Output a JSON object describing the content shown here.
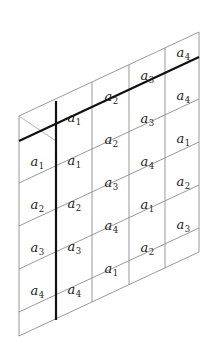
{
  "figure": {
    "geometry": {
      "canvas_width": 218,
      "canvas_height": 354,
      "columns": 5,
      "rows": 5,
      "column_width": 36,
      "row_height": 43,
      "column_rise": 21,
      "left_edge_x": 19,
      "right_edge_x": 199,
      "left_edge_top_y": 116,
      "left_edge_bottom_y": 336,
      "right_edge_top_y": 32,
      "right_edge_bottom_y": 252
    },
    "colors": {
      "background": "#ffffff",
      "thin_rule": "#8d8d8d",
      "thin_rule_faint": "#a8a8a8",
      "bold_rule": "#111111",
      "label_text": "#1b1b1b"
    },
    "symbol_base": "a",
    "subscripts_used": [
      "1",
      "2",
      "3",
      "4"
    ]
  },
  "columns": [
    {
      "index": 1,
      "name": "column-1",
      "cells": [
        {
          "label": "a",
          "sub": "1",
          "x": 37,
          "y": 161
        },
        {
          "label": "a",
          "sub": "2",
          "x": 37,
          "y": 204
        },
        {
          "label": "a",
          "sub": "3",
          "x": 37,
          "y": 247
        },
        {
          "label": "a",
          "sub": "4",
          "x": 37,
          "y": 290
        }
      ]
    },
    {
      "index": 2,
      "name": "column-2",
      "cells": [
        {
          "label": "a",
          "sub": "1",
          "x": 74,
          "y": 117
        },
        {
          "label": "a",
          "sub": "1",
          "x": 74,
          "y": 160
        },
        {
          "label": "a",
          "sub": "2",
          "x": 74,
          "y": 203
        },
        {
          "label": "a",
          "sub": "3",
          "x": 74,
          "y": 246
        },
        {
          "label": "a",
          "sub": "4",
          "x": 74,
          "y": 289
        }
      ]
    },
    {
      "index": 3,
      "name": "column-3",
      "cells": [
        {
          "label": "a",
          "sub": "2",
          "x": 111,
          "y": 96
        },
        {
          "label": "a",
          "sub": "2",
          "x": 111,
          "y": 139
        },
        {
          "label": "a",
          "sub": "3",
          "x": 111,
          "y": 182
        },
        {
          "label": "a",
          "sub": "4",
          "x": 111,
          "y": 225
        },
        {
          "label": "a",
          "sub": "1",
          "x": 111,
          "y": 268
        }
      ]
    },
    {
      "index": 4,
      "name": "column-4",
      "cells": [
        {
          "label": "a",
          "sub": "3",
          "x": 147,
          "y": 75
        },
        {
          "label": "a",
          "sub": "3",
          "x": 147,
          "y": 118
        },
        {
          "label": "a",
          "sub": "4",
          "x": 147,
          "y": 161
        },
        {
          "label": "a",
          "sub": "1",
          "x": 147,
          "y": 204
        },
        {
          "label": "a",
          "sub": "2",
          "x": 147,
          "y": 247
        }
      ]
    },
    {
      "index": 5,
      "name": "column-5",
      "cells": [
        {
          "label": "a",
          "sub": "4",
          "x": 183,
          "y": 52
        },
        {
          "label": "a",
          "sub": "4",
          "x": 183,
          "y": 95
        },
        {
          "label": "a",
          "sub": "1",
          "x": 183,
          "y": 138
        },
        {
          "label": "a",
          "sub": "2",
          "x": 183,
          "y": 181
        },
        {
          "label": "a",
          "sub": "3",
          "x": 183,
          "y": 224
        }
      ]
    }
  ],
  "bold_marks": [
    {
      "name": "bold-vertical-separator",
      "kind": "vertical",
      "x1": 56,
      "y1": 101,
      "x2": 56,
      "y2": 320
    },
    {
      "name": "bold-diagonal-separator",
      "kind": "diagonal",
      "x1": 19,
      "y1": 141,
      "x2": 199,
      "y2": 57
    }
  ]
}
